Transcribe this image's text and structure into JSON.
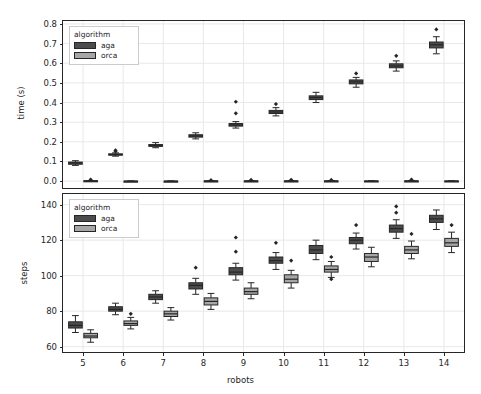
{
  "figure": {
    "width": 481,
    "height": 394,
    "background": "#ffffff",
    "line_color": "#262626",
    "grid_color": "#e8e8e8"
  },
  "legend": {
    "title": "algorithm",
    "entries": [
      {
        "label": "aga",
        "color": "#4c4c4c"
      },
      {
        "label": "orca",
        "color": "#a6a6a6"
      }
    ]
  },
  "chart_data": [
    {
      "type": "box",
      "id": "time-panel",
      "title": "",
      "xlabel": "",
      "ylabel": "time (s)",
      "categories": [
        "5",
        "6",
        "7",
        "8",
        "9",
        "10",
        "11",
        "12",
        "13",
        "14"
      ],
      "xlim": [
        4.5,
        14.5
      ],
      "ylim": [
        -0.035,
        0.815
      ],
      "yticks": [
        0.0,
        0.1,
        0.2,
        0.3,
        0.4,
        0.5,
        0.6,
        0.7,
        0.8
      ],
      "ytick_labels": [
        "0.0",
        "0.1",
        "0.2",
        "0.3",
        "0.4",
        "0.5",
        "0.6",
        "0.7",
        "0.8"
      ],
      "grid": true,
      "legend_position": "upper-left",
      "series": [
        {
          "name": "aga",
          "color": "#4c4c4c",
          "boxes": [
            {
              "category": "5",
              "whislo": 0.08,
              "q1": 0.086,
              "med": 0.092,
              "q3": 0.097,
              "whishi": 0.104,
              "fliers": []
            },
            {
              "category": "6",
              "whislo": 0.127,
              "q1": 0.132,
              "med": 0.135,
              "q3": 0.139,
              "whishi": 0.144,
              "fliers": [
                0.152,
                0.157
              ]
            },
            {
              "category": "7",
              "whislo": 0.17,
              "q1": 0.177,
              "med": 0.181,
              "q3": 0.186,
              "whishi": 0.196,
              "fliers": []
            },
            {
              "category": "8",
              "whislo": 0.215,
              "q1": 0.224,
              "med": 0.23,
              "q3": 0.236,
              "whishi": 0.246,
              "fliers": []
            },
            {
              "category": "9",
              "whislo": 0.27,
              "q1": 0.28,
              "med": 0.286,
              "q3": 0.293,
              "whishi": 0.303,
              "fliers": [
                0.345,
                0.404
              ]
            },
            {
              "category": "10",
              "whislo": 0.332,
              "q1": 0.344,
              "med": 0.352,
              "q3": 0.36,
              "whishi": 0.374,
              "fliers": [
                0.392
              ]
            },
            {
              "category": "11",
              "whislo": 0.4,
              "q1": 0.415,
              "med": 0.425,
              "q3": 0.434,
              "whishi": 0.452,
              "fliers": []
            },
            {
              "category": "12",
              "whislo": 0.478,
              "q1": 0.495,
              "med": 0.505,
              "q3": 0.515,
              "whishi": 0.528,
              "fliers": [
                0.548
              ]
            },
            {
              "category": "13",
              "whislo": 0.56,
              "q1": 0.577,
              "med": 0.586,
              "q3": 0.597,
              "whishi": 0.612,
              "fliers": [
                0.638
              ]
            },
            {
              "category": "14",
              "whislo": 0.648,
              "q1": 0.678,
              "med": 0.694,
              "q3": 0.708,
              "whishi": 0.735,
              "fliers": [
                0.772
              ]
            }
          ]
        },
        {
          "name": "orca",
          "color": "#a6a6a6",
          "boxes": [
            {
              "category": "5",
              "whislo": 0.0,
              "q1": 0.0,
              "med": 0.001,
              "q3": 0.002,
              "whishi": 0.003,
              "fliers": [
                0.008
              ]
            },
            {
              "category": "6",
              "whislo": 0.0,
              "q1": 0.0,
              "med": 0.0,
              "q3": 0.0,
              "whishi": 0.0,
              "fliers": []
            },
            {
              "category": "7",
              "whislo": 0.0,
              "q1": 0.0,
              "med": 0.0,
              "q3": 0.0,
              "whishi": 0.0,
              "fliers": []
            },
            {
              "category": "8",
              "whislo": 0.0,
              "q1": 0.0,
              "med": 0.001,
              "q3": 0.001,
              "whishi": 0.002,
              "fliers": [
                0.005
              ]
            },
            {
              "category": "9",
              "whislo": 0.0,
              "q1": 0.0,
              "med": 0.001,
              "q3": 0.001,
              "whishi": 0.002,
              "fliers": [
                0.006
              ]
            },
            {
              "category": "10",
              "whislo": 0.0,
              "q1": 0.0,
              "med": 0.001,
              "q3": 0.001,
              "whishi": 0.002,
              "fliers": [
                0.007
              ]
            },
            {
              "category": "11",
              "whislo": 0.0,
              "q1": 0.0,
              "med": 0.001,
              "q3": 0.001,
              "whishi": 0.002,
              "fliers": [
                0.006
              ]
            },
            {
              "category": "12",
              "whislo": 0.0,
              "q1": 0.0,
              "med": 0.0,
              "q3": 0.001,
              "whishi": 0.001,
              "fliers": []
            },
            {
              "category": "13",
              "whislo": 0.0,
              "q1": 0.0,
              "med": 0.001,
              "q3": 0.001,
              "whishi": 0.002,
              "fliers": [
                0.008
              ]
            },
            {
              "category": "14",
              "whislo": 0.0,
              "q1": 0.0,
              "med": 0.0,
              "q3": 0.001,
              "whishi": 0.001,
              "fliers": []
            }
          ]
        }
      ]
    },
    {
      "type": "box",
      "id": "steps-panel",
      "title": "",
      "xlabel": "robots",
      "ylabel": "steps",
      "categories": [
        "5",
        "6",
        "7",
        "8",
        "9",
        "10",
        "11",
        "12",
        "13",
        "14"
      ],
      "xlim": [
        4.5,
        14.5
      ],
      "ylim": [
        57.0,
        146.0
      ],
      "yticks": [
        60,
        80,
        100,
        120,
        140
      ],
      "ytick_labels": [
        "60",
        "80",
        "100",
        "120",
        "140"
      ],
      "xtick_labels": [
        "5",
        "6",
        "7",
        "8",
        "9",
        "10",
        "11",
        "12",
        "13",
        "14"
      ],
      "grid": true,
      "legend_position": "upper-left",
      "series": [
        {
          "name": "aga",
          "color": "#4c4c4c",
          "boxes": [
            {
              "category": "5",
              "whislo": 68.0,
              "q1": 70.5,
              "med": 72.0,
              "q3": 74.0,
              "whishi": 77.5,
              "fliers": []
            },
            {
              "category": "6",
              "whislo": 78.0,
              "q1": 80.0,
              "med": 81.0,
              "q3": 82.5,
              "whishi": 84.5,
              "fliers": []
            },
            {
              "category": "7",
              "whislo": 84.5,
              "q1": 86.5,
              "med": 88.0,
              "q3": 89.5,
              "whishi": 91.5,
              "fliers": []
            },
            {
              "category": "8",
              "whislo": 89.5,
              "q1": 92.5,
              "med": 94.5,
              "q3": 96.0,
              "whishi": 98.5,
              "fliers": [
                104.5
              ]
            },
            {
              "category": "9",
              "whislo": 97.5,
              "q1": 100.5,
              "med": 102.0,
              "q3": 104.5,
              "whishi": 107.0,
              "fliers": [
                113.5,
                121.5
              ]
            },
            {
              "category": "10",
              "whislo": 103.5,
              "q1": 107.0,
              "med": 108.5,
              "q3": 110.5,
              "whishi": 113.0,
              "fliers": [
                118.5
              ]
            },
            {
              "category": "11",
              "whislo": 109.0,
              "q1": 112.5,
              "med": 114.5,
              "q3": 117.0,
              "whishi": 120.0,
              "fliers": []
            },
            {
              "category": "12",
              "whislo": 115.0,
              "q1": 118.0,
              "med": 120.0,
              "q3": 121.5,
              "whishi": 124.0,
              "fliers": [
                128.5
              ]
            },
            {
              "category": "13",
              "whislo": 121.0,
              "q1": 124.5,
              "med": 126.5,
              "q3": 128.5,
              "whishi": 131.5,
              "fliers": [
                135.5,
                139.0
              ]
            },
            {
              "category": "14",
              "whislo": 126.0,
              "q1": 130.0,
              "med": 132.0,
              "q3": 134.0,
              "whishi": 137.0,
              "fliers": []
            }
          ]
        },
        {
          "name": "orca",
          "color": "#a6a6a6",
          "boxes": [
            {
              "category": "5",
              "whislo": 62.5,
              "q1": 65.0,
              "med": 66.0,
              "q3": 67.5,
              "whishi": 69.5,
              "fliers": []
            },
            {
              "category": "6",
              "whislo": 70.0,
              "q1": 72.0,
              "med": 73.0,
              "q3": 74.5,
              "whishi": 76.5,
              "fliers": [
                78.5
              ]
            },
            {
              "category": "7",
              "whislo": 75.0,
              "q1": 77.0,
              "med": 78.5,
              "q3": 80.0,
              "whishi": 82.0,
              "fliers": []
            },
            {
              "category": "8",
              "whislo": 81.0,
              "q1": 83.5,
              "med": 85.5,
              "q3": 87.5,
              "whishi": 90.0,
              "fliers": []
            },
            {
              "category": "9",
              "whislo": 87.0,
              "q1": 89.5,
              "med": 91.0,
              "q3": 93.0,
              "whishi": 96.0,
              "fliers": []
            },
            {
              "category": "10",
              "whislo": 93.0,
              "q1": 96.0,
              "med": 98.0,
              "q3": 100.5,
              "whishi": 103.0,
              "fliers": [
                108.5
              ]
            },
            {
              "category": "11",
              "whislo": 99.0,
              "q1": 102.0,
              "med": 103.5,
              "q3": 105.5,
              "whishi": 108.0,
              "fliers": [
                98.0,
                110.5
              ]
            },
            {
              "category": "12",
              "whislo": 105.0,
              "q1": 108.0,
              "med": 110.5,
              "q3": 112.5,
              "whishi": 116.0,
              "fliers": []
            },
            {
              "category": "13",
              "whislo": 109.5,
              "q1": 112.5,
              "med": 114.5,
              "q3": 116.5,
              "whishi": 119.5,
              "fliers": [
                123.5
              ]
            },
            {
              "category": "14",
              "whislo": 113.0,
              "q1": 116.5,
              "med": 118.5,
              "q3": 121.0,
              "whishi": 124.5,
              "fliers": [
                128.5
              ]
            }
          ]
        }
      ]
    }
  ]
}
